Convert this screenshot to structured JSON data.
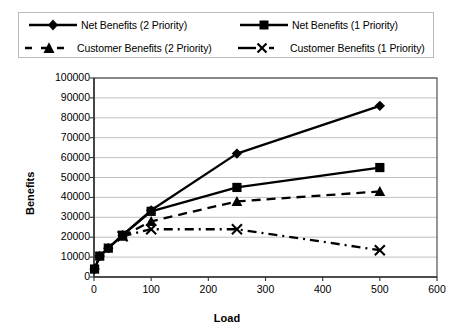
{
  "chart_data": {
    "type": "line",
    "title": "",
    "xlabel": "Load",
    "ylabel": "Benefits",
    "xlim": [
      0,
      600
    ],
    "ylim": [
      0,
      100000
    ],
    "xticks": [
      0,
      100,
      200,
      300,
      400,
      500,
      600
    ],
    "yticks": [
      0,
      10000,
      20000,
      30000,
      40000,
      50000,
      60000,
      70000,
      80000,
      90000,
      100000
    ],
    "xtick_labels": [
      "0",
      "100",
      "200",
      "300",
      "400",
      "500",
      "600"
    ],
    "ytick_labels": [
      "0",
      "10000",
      "20000",
      "30000",
      "40000",
      "50000",
      "60000",
      "70000",
      "80000",
      "90000",
      "100000"
    ],
    "grid": "horizontal",
    "legend_position": "top",
    "series": [
      {
        "name": "Net Benefits (2 Priority)",
        "marker": "diamond",
        "line_style": "solid",
        "color": "#000000",
        "x": [
          1,
          10,
          25,
          50,
          100,
          250,
          500
        ],
        "values": [
          4000,
          10500,
          14500,
          21000,
          33500,
          62000,
          86000
        ]
      },
      {
        "name": "Net Benefits (1 Priority)",
        "marker": "square",
        "line_style": "solid",
        "color": "#000000",
        "x": [
          1,
          10,
          25,
          50,
          100,
          250,
          500
        ],
        "values": [
          4000,
          10500,
          14500,
          21000,
          33000,
          45000,
          55000
        ]
      },
      {
        "name": "Customer Benefits (2 Priority)",
        "marker": "triangle",
        "line_style": "dashed",
        "color": "#000000",
        "x": [
          50,
          100,
          250,
          500
        ],
        "values": [
          20500,
          28000,
          38000,
          43000
        ]
      },
      {
        "name": "Customer Benefits (1 Priority)",
        "marker": "x",
        "line_style": "dashdot",
        "color": "#000000",
        "x": [
          50,
          100,
          250,
          500
        ],
        "values": [
          20500,
          24000,
          24000,
          13500
        ]
      }
    ]
  },
  "legend": {
    "entries": [
      {
        "label": "Net Benefits (2 Priority)"
      },
      {
        "label": "Net Benefits (1 Priority)"
      },
      {
        "label": "Customer Benefits (2 Priority)"
      },
      {
        "label": "Customer Benefits (1 Priority)"
      }
    ]
  },
  "colors": {
    "ink": "#000000",
    "grid": "#b0b0b0",
    "axis": "#404040",
    "legend_border": "#b9b9b9"
  }
}
